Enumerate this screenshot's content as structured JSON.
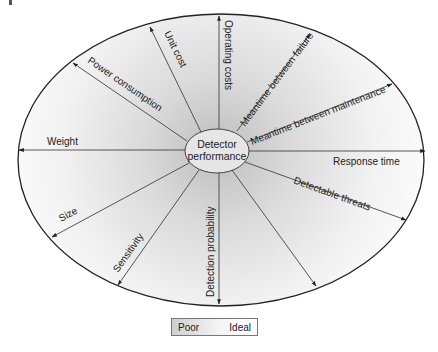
{
  "diagram": {
    "center_label_line1": "Detector",
    "center_label_line2": "performance",
    "axes": [
      {
        "label": "Operating costs"
      },
      {
        "label": "Unit cost"
      },
      {
        "label": "Power consumption"
      },
      {
        "label": "Weight"
      },
      {
        "label": "Size"
      },
      {
        "label": "Sensitivity"
      },
      {
        "label": "Detection probability"
      },
      {
        "label": ""
      },
      {
        "label": "Detectable threats"
      },
      {
        "label": "Response time"
      },
      {
        "label": "Meantime between maintenance"
      },
      {
        "label": "Meantime between failure"
      }
    ]
  },
  "legend": {
    "low_label": "Poor",
    "high_label": "Ideal"
  },
  "colors": {
    "outline": "#222222",
    "axis": "#444444",
    "gradient_dark": "#c8c8c8",
    "gradient_light": "#ffffff"
  }
}
